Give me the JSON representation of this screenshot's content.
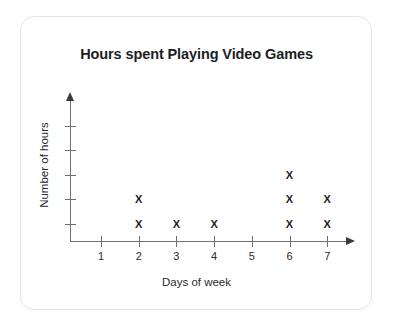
{
  "card": {
    "border_color": "#e3e3e3",
    "background": "#ffffff"
  },
  "chart_data": {
    "type": "scatter",
    "plot_style": "dot-plot-x-marks",
    "title": "Hours spent Playing Video Games",
    "xlabel": "Days of week",
    "ylabel": "Number of hours",
    "categories": [
      "1",
      "2",
      "3",
      "4",
      "5",
      "6",
      "7"
    ],
    "x": [
      1,
      2,
      3,
      4,
      5,
      6,
      7
    ],
    "values": [
      0,
      2,
      1,
      1,
      0,
      3,
      2
    ],
    "xlim": [
      0.5,
      7.5
    ],
    "ylim": [
      0,
      5
    ],
    "y_ticks": [
      "1",
      "2",
      "3",
      "4",
      "5"
    ],
    "y_tick_values": [
      1,
      2,
      3,
      4,
      5
    ],
    "grid": false,
    "legend": false,
    "marker": "X",
    "marker_color": "#1d1d1f",
    "axis_color": "#6f6f6f",
    "points": [
      {
        "day": 2,
        "level": 1,
        "marker": "X"
      },
      {
        "day": 2,
        "level": 2,
        "marker": "X"
      },
      {
        "day": 3,
        "level": 1,
        "marker": "X"
      },
      {
        "day": 4,
        "level": 1,
        "marker": "X"
      },
      {
        "day": 6,
        "level": 1,
        "marker": "X"
      },
      {
        "day": 6,
        "level": 2,
        "marker": "X"
      },
      {
        "day": 6,
        "level": 3,
        "marker": "X"
      },
      {
        "day": 7,
        "level": 1,
        "marker": "X"
      },
      {
        "day": 7,
        "level": 2,
        "marker": "X"
      }
    ]
  }
}
